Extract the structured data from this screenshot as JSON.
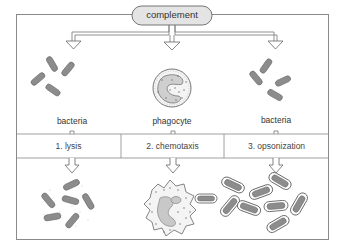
{
  "diagram": {
    "source": {
      "label": "complement"
    },
    "targets": [
      {
        "label": "bacteria",
        "position": "left"
      },
      {
        "label": "phagocyte",
        "position": "center"
      },
      {
        "label": "bacteria",
        "position": "right"
      }
    ],
    "processes": [
      {
        "label": "1. lysis"
      },
      {
        "label": "2. chemotaxis"
      },
      {
        "label": "3. opsonization"
      }
    ],
    "outcomes": [
      {
        "description": "lysed bacteria fragments",
        "position": "left"
      },
      {
        "description": "phagocyte engulfing coated bacterium",
        "position": "center"
      },
      {
        "description": "opsonized bacteria with outlined coats",
        "position": "right"
      }
    ],
    "colors": {
      "frame": "#8a8a8a",
      "pill_fill": "#e4e4e4",
      "bacteria_fill": "#8c8c8c",
      "line": "#666666"
    }
  }
}
